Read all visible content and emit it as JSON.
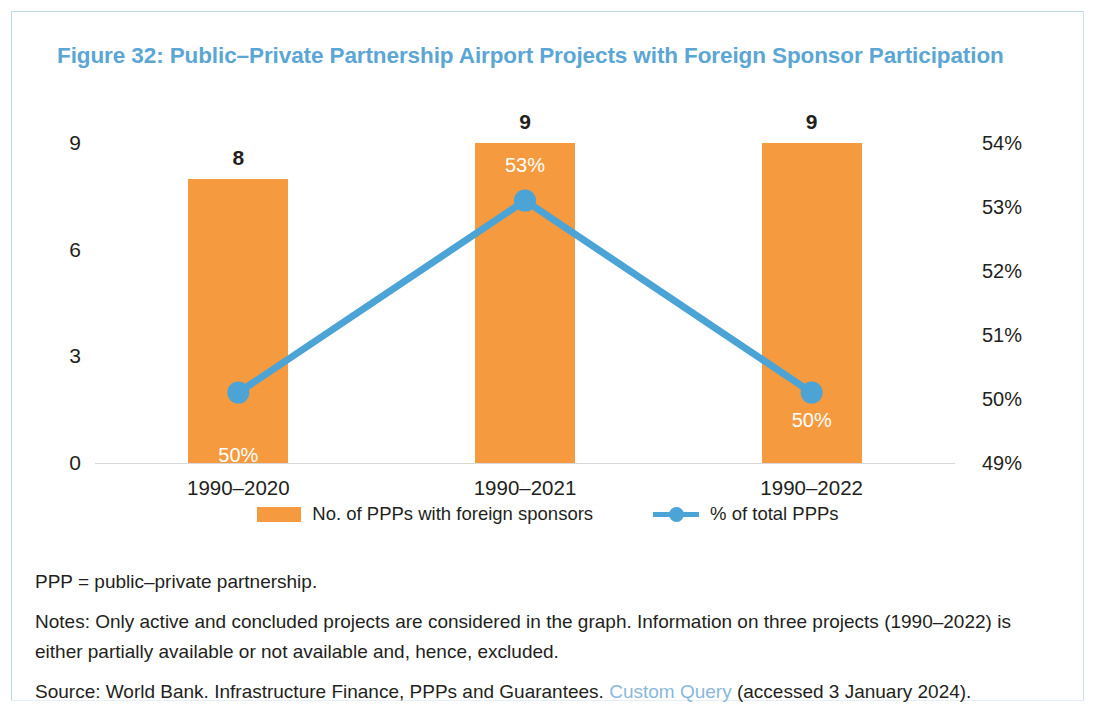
{
  "figure": {
    "title": "Figure 32: Public–Private Partnership Airport Projects with Foreign Sponsor Participation",
    "title_color": "#5ba6d4",
    "bar_color": "#f59a3e",
    "line_color": "#4ca3d6",
    "frame_color": "#bcd9e8"
  },
  "chart_data": {
    "type": "bar",
    "title": "Figure 32: Public–Private Partnership Airport Projects with Foreign Sponsor Participation",
    "xlabel": "",
    "ylabel": "",
    "categories": [
      "1990–2020",
      "1990–2021",
      "1990–2022"
    ],
    "grid": false,
    "legend_position": "bottom",
    "series": [
      {
        "name": "No. of PPPs with foreign sponsors",
        "type": "bar",
        "axis": "left",
        "color": "#f59a3e",
        "values": [
          8,
          9,
          9
        ],
        "data_labels": [
          "8",
          "9",
          "9"
        ]
      },
      {
        "name": "% of total PPPs",
        "type": "line",
        "axis": "right",
        "color": "#4ca3d6",
        "values": [
          50.1,
          53.1,
          50.1
        ],
        "data_labels": [
          "50%",
          "53%",
          "50%"
        ]
      }
    ],
    "left_axis": {
      "ticks": [
        "0",
        "3",
        "6",
        "9"
      ],
      "tick_values": [
        0,
        3,
        6,
        9
      ],
      "ylim": [
        0,
        9
      ]
    },
    "right_axis": {
      "ticks": [
        "49%",
        "50%",
        "51%",
        "52%",
        "53%",
        "54%"
      ],
      "tick_values": [
        49,
        50,
        51,
        52,
        53,
        54
      ],
      "ylim": [
        49,
        54
      ]
    }
  },
  "legend": {
    "items": [
      {
        "label": "No. of PPPs with foreign sponsors",
        "marker": "bar-swatch"
      },
      {
        "label": "% of total PPPs",
        "marker": "line-marker-swatch"
      }
    ]
  },
  "notes": {
    "abbreviation": "PPP = public–private partnership.",
    "note": "Notes: Only active and concluded projects are considered in the graph. Information on three projects (1990–2022) is either partially available or not available and, hence, excluded.",
    "source_prefix": "Source: World Bank. Infrastructure Finance, PPPs and Guarantees. ",
    "source_link": "Custom Query",
    "source_suffix": " (accessed 3 January 2024)."
  }
}
